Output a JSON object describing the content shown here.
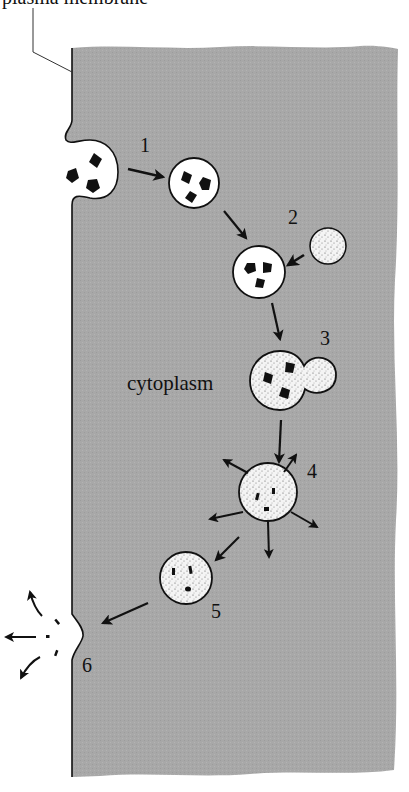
{
  "figure": {
    "title_label": "plasma membrane",
    "region_label": "cytoplasm",
    "colors": {
      "cytoplasm": "#a9a9a9",
      "outline": "#111111",
      "vesicle_fill": "#ffffff",
      "lysosome_fill": "#ececec",
      "particle": "#111111",
      "background": "#ffffff"
    },
    "steps": [
      {
        "id": "1",
        "label": "1",
        "description": "endocytosed vesicle with particles moves inward"
      },
      {
        "id": "2",
        "label": "2",
        "description": "lysosome approaches phagosome"
      },
      {
        "id": "3",
        "label": "3",
        "description": "lysosome fuses with phagosome"
      },
      {
        "id": "4",
        "label": "4",
        "description": "digestion; products diffuse out"
      },
      {
        "id": "5",
        "label": "5",
        "description": "residual body with undigested remnants"
      },
      {
        "id": "6",
        "label": "6",
        "description": "exocytosis of residues out of cell"
      }
    ]
  }
}
